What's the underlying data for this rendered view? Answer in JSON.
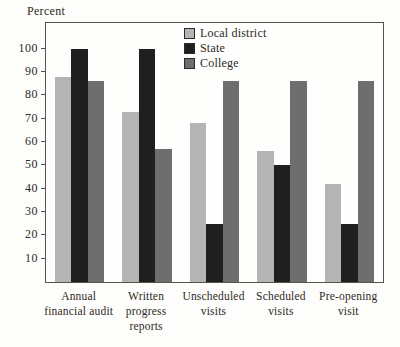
{
  "chart_data": {
    "type": "bar",
    "title": "",
    "xlabel": "",
    "ylabel": "Percent",
    "categories": [
      "Annual financial audit",
      "Written progress reports",
      "Unscheduled visits",
      "Scheduled visits",
      "Pre-opening visit"
    ],
    "series": [
      {
        "name": "Local district",
        "color": "#b4b4b4",
        "values": [
          88,
          73,
          68,
          56,
          42
        ]
      },
      {
        "name": "State",
        "color": "#1f1f1f",
        "values": [
          100,
          100,
          25,
          50,
          25
        ]
      },
      {
        "name": "College",
        "color": "#6e6e6e",
        "values": [
          86,
          57,
          86,
          86,
          86
        ]
      }
    ],
    "ylim": [
      0,
      111
    ],
    "yticks": [
      10,
      20,
      30,
      40,
      50,
      60,
      70,
      80,
      90,
      100
    ],
    "grid": false,
    "legend_position": "inside-top-center",
    "frame": "full-box"
  }
}
